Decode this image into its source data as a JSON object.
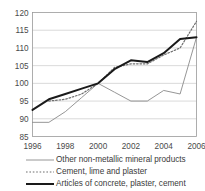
{
  "chart_data": {
    "type": "line",
    "title": "",
    "xlabel": "",
    "ylabel": "",
    "xlim": [
      1996,
      2006
    ],
    "ylim": [
      85,
      120
    ],
    "yticks": [
      85,
      90,
      95,
      100,
      105,
      110,
      115,
      120
    ],
    "xticks": [
      1996,
      1998,
      2000,
      2002,
      2004,
      2006
    ],
    "x": [
      1996,
      1997,
      1998,
      1999,
      2000,
      2001,
      2002,
      2003,
      2004,
      2005,
      2006
    ],
    "grid": true,
    "legend_position": "bottom",
    "series": [
      {
        "name": "Other non-metallic mineral products",
        "style": "solid-thin",
        "color": "#8a8a8a",
        "x": [
          1996,
          1997,
          1998,
          1999,
          2000,
          2001,
          2002,
          2003,
          2004,
          2005,
          2006
        ],
        "values": [
          89,
          89,
          92,
          96,
          100,
          97.5,
          95,
          95,
          98,
          97,
          113
        ]
      },
      {
        "name": "Cement, lime and plaster",
        "style": "dashed",
        "color": "#6f6f6f",
        "x": [
          1997,
          1998,
          1999,
          2000,
          2001,
          2002,
          2003,
          2004,
          2005,
          2006
        ],
        "values": [
          95,
          95.5,
          97,
          100,
          104.5,
          105.5,
          105.5,
          108,
          110,
          117.5
        ]
      },
      {
        "name": "Articles of concrete, plaster, cement",
        "style": "solid-thick",
        "color": "#1a1a1a",
        "x": [
          1996,
          1997,
          1998,
          1999,
          2000,
          2001,
          2002,
          2003,
          2004,
          2005,
          2006
        ],
        "values": [
          92.5,
          95.5,
          97,
          98.5,
          100,
          104,
          106.5,
          106,
          108.5,
          112.5,
          113
        ]
      }
    ]
  },
  "axis": {
    "ytick_labels": [
      "120",
      "115",
      "110",
      "105",
      "100",
      "95",
      "90",
      "85"
    ],
    "xtick_labels": [
      "1996",
      "1998",
      "2000",
      "2002",
      "2004",
      "2006"
    ]
  },
  "legend": {
    "items": [
      {
        "label": "Other non-metallic mineral products"
      },
      {
        "label": "Cement, lime and plaster"
      },
      {
        "label": "Articles of concrete, plaster, cement"
      }
    ]
  }
}
